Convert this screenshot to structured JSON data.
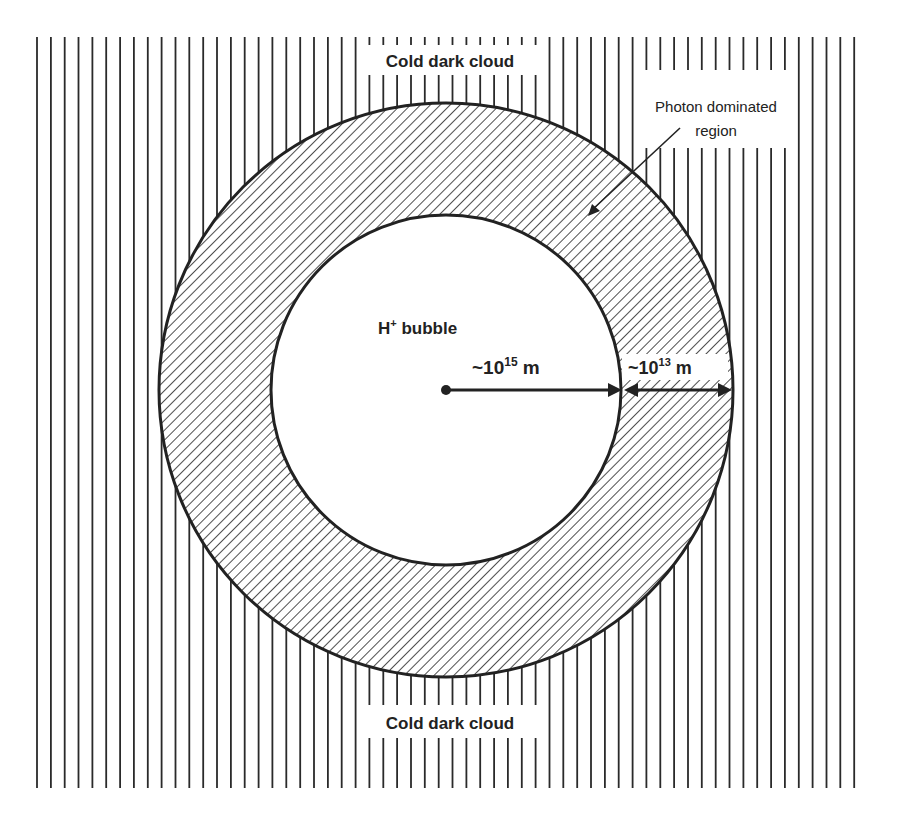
{
  "diagram": {
    "type": "concentric-regions",
    "regions": [
      {
        "id": "cold-dark-cloud",
        "label_top": "Cold dark cloud",
        "label_bottom": "Cold dark cloud",
        "fill": "vertical-lines"
      },
      {
        "id": "photon-dominated-region",
        "label_line1": "Photon dominated",
        "label_line2": "region",
        "fill": "diagonal-hatch"
      },
      {
        "id": "h-plus-bubble",
        "label_main": "H",
        "label_sup": "+",
        "label_rest": " bubble",
        "fill": "white"
      }
    ],
    "dimensions": {
      "bubble_radius": {
        "prefix": "~10",
        "exp": "15",
        "unit": " m"
      },
      "pdr_thickness": {
        "prefix": "~10",
        "exp": "13",
        "unit": " m"
      }
    },
    "colors": {
      "ink": "#222222",
      "background": "#ffffff"
    }
  }
}
